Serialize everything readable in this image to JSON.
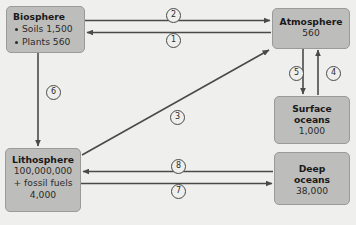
{
  "diagram": {
    "background_color": "#efefed",
    "box_fill_color": "#bdbdbb",
    "box_border_color": "#9a9a98",
    "arrow_color": "#4a4a48"
  },
  "nodes": {
    "biosphere": {
      "title": "Biosphere",
      "bullets": [
        {
          "label": "Soils",
          "value": "1,500",
          "text": "Soils 1,500"
        },
        {
          "label": "Plants",
          "value": "560",
          "text": "Plants 560"
        }
      ]
    },
    "atmosphere": {
      "title": "Atmosphere",
      "value": "560"
    },
    "surface_oceans": {
      "title_line1": "Surface",
      "title_line2": "oceans",
      "value": "1,000"
    },
    "deep_oceans": {
      "title_line1": "Deep",
      "title_line2": "oceans",
      "value": "38,000"
    },
    "lithosphere": {
      "title": "Lithosphere",
      "value": "100,000,000",
      "extra_label": "+ fossil fuels",
      "extra_value": "4,000"
    }
  },
  "fluxes": [
    {
      "id": "1",
      "label": "1",
      "from": "Atmosphere",
      "to": "Biosphere"
    },
    {
      "id": "2",
      "label": "2",
      "from": "Biosphere",
      "to": "Atmosphere"
    },
    {
      "id": "3",
      "label": "3",
      "from": "Lithosphere",
      "to": "Atmosphere"
    },
    {
      "id": "4",
      "label": "4",
      "from": "Surface oceans",
      "to": "Atmosphere"
    },
    {
      "id": "5",
      "label": "5",
      "from": "Atmosphere",
      "to": "Surface oceans"
    },
    {
      "id": "6",
      "label": "6",
      "from": "Biosphere",
      "to": "Lithosphere"
    },
    {
      "id": "7",
      "label": "7",
      "from": "Lithosphere",
      "to": "Deep oceans"
    },
    {
      "id": "8",
      "label": "8",
      "from": "Deep oceans",
      "to": "Lithosphere"
    }
  ]
}
